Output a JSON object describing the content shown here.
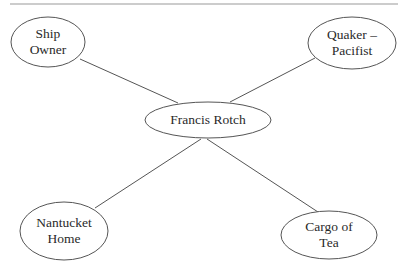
{
  "diagram": {
    "type": "concept-map",
    "top_rule": {
      "x1": 10,
      "x2": 398,
      "y": 4,
      "color": "#9a9a9a"
    },
    "stroke_color": "#555555",
    "center": {
      "id": "francis-rotch",
      "lines": [
        "Francis Rotch"
      ],
      "cx": 208,
      "cy": 120,
      "rx": 63,
      "ry": 18
    },
    "nodes": [
      {
        "id": "ship-owner",
        "lines": [
          "Ship",
          "Owner"
        ],
        "cx": 48,
        "cy": 42,
        "rx": 37,
        "ry": 25,
        "edge": {
          "x1": 80,
          "y1": 59,
          "x2": 178,
          "y2": 103
        }
      },
      {
        "id": "quaker-pacifist",
        "lines": [
          "Quaker –",
          "Pacifist"
        ],
        "cx": 352,
        "cy": 43,
        "rx": 44,
        "ry": 26,
        "edge": {
          "x1": 315,
          "y1": 58,
          "x2": 230,
          "y2": 102
        }
      },
      {
        "id": "nantucket-home",
        "lines": [
          "Nantucket",
          "Home"
        ],
        "cx": 64,
        "cy": 231,
        "rx": 44,
        "ry": 29,
        "edge": {
          "x1": 95,
          "y1": 208,
          "x2": 201,
          "y2": 139
        }
      },
      {
        "id": "cargo-of-tea",
        "lines": [
          "Cargo of",
          "Tea"
        ],
        "cx": 329,
        "cy": 235,
        "rx": 48,
        "ry": 24,
        "edge": {
          "x1": 318,
          "y1": 212,
          "x2": 207,
          "y2": 139
        }
      }
    ]
  }
}
